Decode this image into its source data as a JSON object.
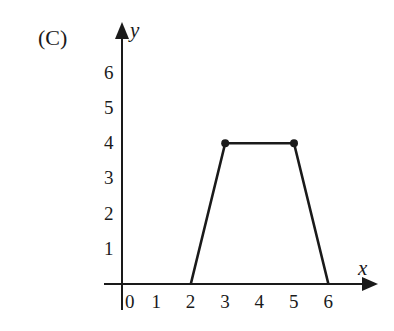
{
  "panel_label": "(C)",
  "chart_data": {
    "type": "line",
    "title": "",
    "xlabel": "x",
    "ylabel": "y",
    "x": [
      2,
      3,
      5,
      6
    ],
    "y": [
      0,
      4,
      4,
      0
    ],
    "series": [
      {
        "name": "graph",
        "points": [
          [
            2,
            0
          ],
          [
            3,
            4
          ],
          [
            5,
            4
          ],
          [
            6,
            0
          ]
        ],
        "marked_points": [
          [
            3,
            4
          ],
          [
            5,
            4
          ]
        ]
      }
    ],
    "xticks": [
      "0",
      "1",
      "2",
      "3",
      "4",
      "5",
      "6"
    ],
    "yticks": [
      "1",
      "2",
      "3",
      "4",
      "5",
      "6"
    ],
    "xlim": [
      0,
      7
    ],
    "ylim": [
      0,
      7
    ],
    "grid": false,
    "legend": null
  }
}
